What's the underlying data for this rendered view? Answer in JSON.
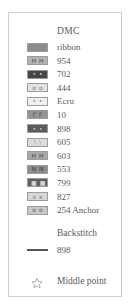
{
  "legend": {
    "header": "DMC",
    "floss": [
      {
        "label": "ribbon",
        "color": "#8c8c8c",
        "symbol": "",
        "symbol_color": "#3a3a3a"
      },
      {
        "label": "954",
        "color": "#b4b4b4",
        "symbol": "HH",
        "symbol_color": "#4a4a4a"
      },
      {
        "label": "702",
        "color": "#454545",
        "symbol": "••",
        "symbol_color": "#d8d8d8"
      },
      {
        "label": "444",
        "color": "#e2e2e2",
        "symbol": "oo",
        "symbol_color": "#7a7a7a"
      },
      {
        "label": "Ecru",
        "color": "#efefef",
        "symbol": "••",
        "symbol_color": "#8a8a8a"
      },
      {
        "label": "10",
        "color": "#949494",
        "symbol": "ΓΓ",
        "symbol_color": "#3d3d3d"
      },
      {
        "label": "898",
        "color": "#5b5b5b",
        "symbol": "••",
        "symbol_color": "#cfcfcf"
      },
      {
        "label": "605",
        "color": "#dcdcdc",
        "symbol": "\\\\",
        "symbol_color": "#8a8a8a"
      },
      {
        "label": "603",
        "color": "#a9a9a9",
        "symbol": "HH",
        "symbol_color": "#3f3f3f"
      },
      {
        "label": "553",
        "color": "#8d8d8d",
        "symbol": "NN",
        "symbol_color": "#3b3b3b"
      },
      {
        "label": "799",
        "color": "#616161",
        "symbol": "■■",
        "symbol_color": "#d4d4d4"
      },
      {
        "label": "827",
        "color": "#d7d7d7",
        "symbol": "xx",
        "symbol_color": "#6f6f6f"
      },
      {
        "label": "254 Anchor",
        "color": "#c9c9c9",
        "symbol": "oo",
        "symbol_color": "#5f5f5f"
      }
    ],
    "backstitch": {
      "title": "Backstitch",
      "label": "898",
      "line_color": "#585858"
    },
    "middle_point": {
      "label": "Middle point",
      "icon": "star-outline-icon",
      "icon_color": "#8e8e8e"
    }
  },
  "colors": {
    "border": "#cfcfcf",
    "text": "#5a5a5a",
    "background": "#ffffff"
  }
}
